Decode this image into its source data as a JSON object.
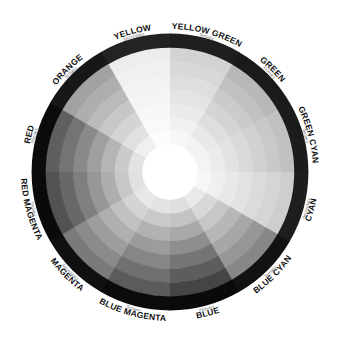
{
  "diagram": {
    "type": "color-wheel-grayscale",
    "center": [
      170,
      172
    ],
    "outer_radius": 138,
    "inner_radius": 14,
    "rings": 9,
    "start_angle_deg": -30,
    "segments": [
      {
        "name": "YELLOW",
        "category": "Secondary",
        "base_lum": 235
      },
      {
        "name": "YELLOW GREEN",
        "category": "Tertiary",
        "base_lum": 205
      },
      {
        "name": "GREEN",
        "category": "Primary",
        "base_lum": 175
      },
      {
        "name": "GREEN CYAN",
        "category": "Tertiary",
        "base_lum": 185
      },
      {
        "name": "CYAN",
        "category": "Secondary",
        "base_lum": 200
      },
      {
        "name": "BLUE CYAN",
        "category": "Tertiary",
        "base_lum": 120
      },
      {
        "name": "BLUE",
        "category": "Primary",
        "base_lum": 45
      },
      {
        "name": "BLUE MAGENTA",
        "category": "Tertiary",
        "base_lum": 70
      },
      {
        "name": "MAGENTA",
        "category": "Secondary",
        "base_lum": 105
      },
      {
        "name": "RED MAGENTA",
        "category": "Tertiary",
        "base_lum": 60
      },
      {
        "name": "RED",
        "category": "Primary",
        "base_lum": 75
      },
      {
        "name": "ORANGE",
        "category": "Tertiary",
        "base_lum": 150
      }
    ]
  }
}
